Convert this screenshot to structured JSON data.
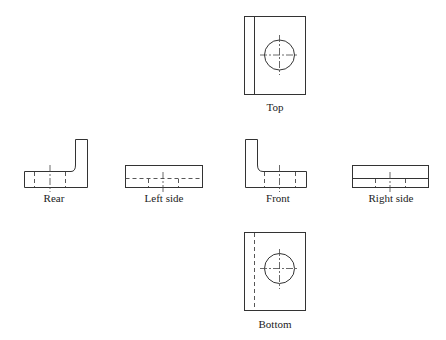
{
  "diagram": {
    "views": {
      "top": {
        "label": "Top"
      },
      "rear": {
        "label": "Rear"
      },
      "left_side": {
        "label": "Left side"
      },
      "front": {
        "label": "Front"
      },
      "right_side": {
        "label": "Right side"
      },
      "bottom": {
        "label": "Bottom"
      }
    },
    "line_color": "#333333",
    "background": "#ffffff"
  }
}
